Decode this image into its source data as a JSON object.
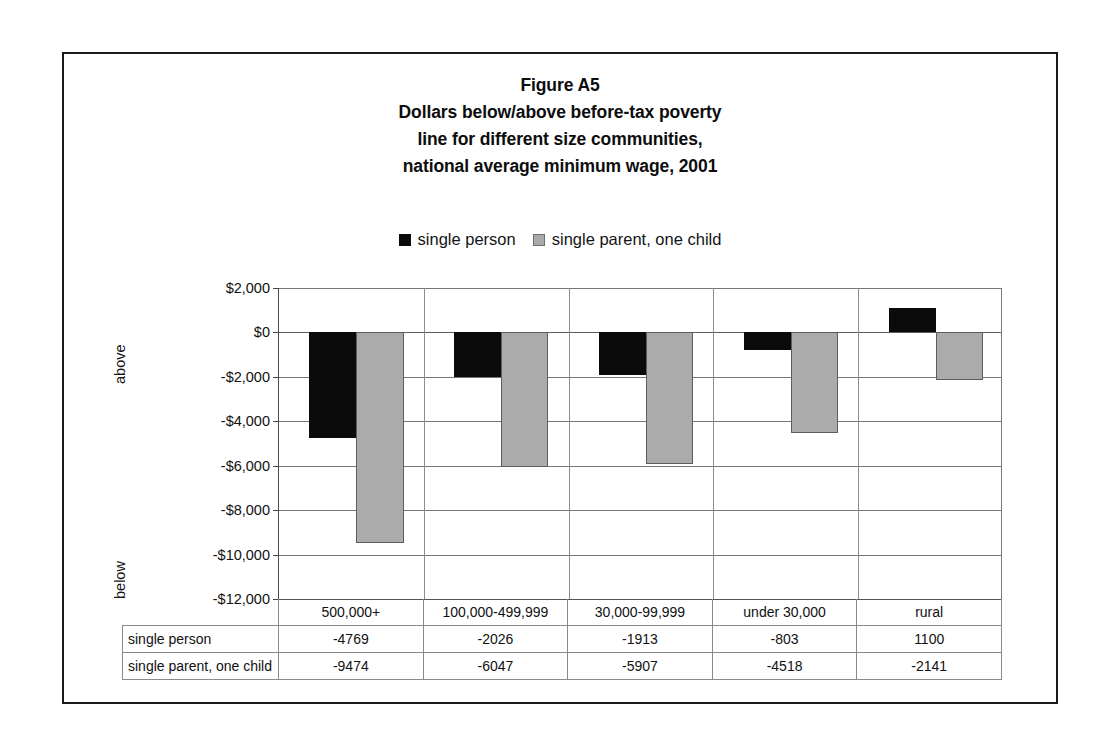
{
  "figure": {
    "title_lines": [
      "Figure A5",
      "Dollars below/above before-tax poverty",
      "line for different size communities,",
      "national average minimum wage, 2001"
    ]
  },
  "legend": {
    "entries": [
      {
        "label": "single person",
        "swatch": "black-square-icon",
        "color": "#0a0a0a"
      },
      {
        "label": "single parent, one child",
        "swatch": "gray-square-icon",
        "color": "#ababab"
      }
    ]
  },
  "axis": {
    "side_label_upper": "above",
    "side_label_lower": "below",
    "y_tick_labels": [
      "$2,000",
      "$0",
      "-$2,000",
      "-$4,000",
      "-$6,000",
      "-$8,000",
      "-$10,000",
      "-$12,000"
    ]
  },
  "table": {
    "row_labels": [
      "single person",
      "single parent, one child"
    ],
    "columns": [
      "500,000+",
      "100,000-499,999",
      "30,000-99,999",
      "under 30,000",
      "rural"
    ],
    "rows": [
      [
        "-4769",
        "-2026",
        "-1913",
        "-803",
        "1100"
      ],
      [
        "-9474",
        "-6047",
        "-5907",
        "-4518",
        "-2141"
      ]
    ]
  },
  "chart_data": {
    "type": "bar",
    "xlabel": "",
    "ylabel": "",
    "ylim": [
      -12000,
      2000
    ],
    "ytick_values": [
      2000,
      0,
      -2000,
      -4000,
      -6000,
      -8000,
      -10000,
      -12000
    ],
    "ytick_labels": [
      "$2,000",
      "$0",
      "-$2,000",
      "-$4,000",
      "-$6,000",
      "-$8,000",
      "-$10,000",
      "-$12,000"
    ],
    "grid": true,
    "legend_position": "top-center",
    "categories": [
      "500,000+",
      "100,000-499,999",
      "30,000-99,999",
      "under 30,000",
      "rural"
    ],
    "series": [
      {
        "name": "single person",
        "color": "#0a0a0a",
        "values": [
          -4769,
          -2026,
          -1913,
          -803,
          1100
        ]
      },
      {
        "name": "single parent, one child",
        "color": "#ababab",
        "values": [
          -9474,
          -6047,
          -5907,
          -4518,
          -2141
        ]
      }
    ]
  }
}
